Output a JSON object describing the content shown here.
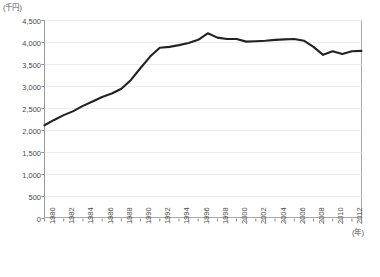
{
  "chart_data": {
    "type": "line",
    "title": "",
    "ylabel": "(千円)",
    "xlabel": "(年)",
    "ylim": [
      0,
      4500
    ],
    "y_ticks": [
      "0",
      "500",
      "1,000",
      "1,500",
      "2,000",
      "2,500",
      "3,000",
      "3,500",
      "4,000",
      "4,500"
    ],
    "y_tick_values": [
      0,
      500,
      1000,
      1500,
      2000,
      2500,
      3000,
      3500,
      4000,
      4500
    ],
    "xlim": [
      1980,
      2013
    ],
    "x_tick_labels": [
      "1980",
      "1982",
      "1984",
      "1986",
      "1988",
      "1990",
      "1992",
      "1994",
      "1996",
      "1998",
      "2000",
      "2002",
      "2004",
      "2006",
      "2008",
      "2010",
      "2012"
    ],
    "grid": true,
    "legend": null,
    "line_color": "#222222",
    "x": [
      1980,
      1981,
      1982,
      1983,
      1984,
      1985,
      1986,
      1987,
      1988,
      1989,
      1990,
      1991,
      1992,
      1993,
      1994,
      1995,
      1996,
      1997,
      1998,
      1999,
      2000,
      2001,
      2002,
      2003,
      2004,
      2005,
      2006,
      2007,
      2008,
      2009,
      2010,
      2011,
      2012,
      2013
    ],
    "values": [
      2120,
      2240,
      2350,
      2440,
      2560,
      2660,
      2760,
      2840,
      2950,
      3150,
      3420,
      3680,
      3880,
      3900,
      3940,
      3990,
      4060,
      4210,
      4110,
      4080,
      4080,
      4020,
      4030,
      4040,
      4060,
      4070,
      4080,
      4040,
      3900,
      3720,
      3800,
      3740,
      3800,
      3810
    ]
  }
}
